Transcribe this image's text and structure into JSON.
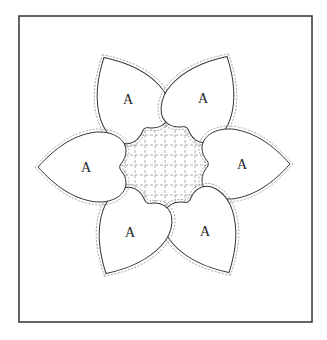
{
  "diagram": {
    "title": "",
    "frame": {
      "x": 19,
      "y": 16,
      "width": 293,
      "height": 306,
      "stroke": "#333333"
    },
    "center": {
      "x": 165,
      "y": 165
    },
    "grid": {
      "spacing": 10,
      "stroke": "#999999",
      "dash": "3,2"
    },
    "hearts": [
      {
        "label": "A",
        "angle": -120,
        "cx": 128,
        "cy": 99
      },
      {
        "label": "A",
        "angle": -60,
        "cx": 203,
        "cy": 98
      },
      {
        "label": "A",
        "angle": 0,
        "cx": 242,
        "cy": 164
      },
      {
        "label": "A",
        "angle": 60,
        "cx": 205,
        "cy": 231
      },
      {
        "label": "A",
        "angle": 120,
        "cx": 130,
        "cy": 232
      },
      {
        "label": "A",
        "angle": 180,
        "cx": 86,
        "cy": 167
      }
    ]
  }
}
